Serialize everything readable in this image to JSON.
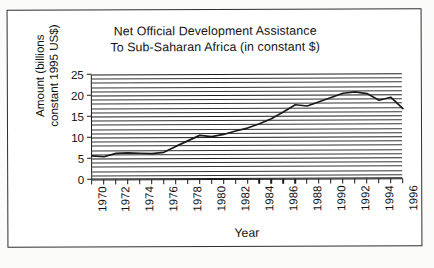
{
  "chart_data": {
    "type": "line",
    "title": "Net Official Development Assistance To Sub-Saharan Africa (in constant $)",
    "title_lines": [
      "Net Official Development Assistance",
      "To Sub-Saharan Africa (in constant $)"
    ],
    "xlabel": "Year",
    "ylabel": "Amount (billions constant 1995 US$)",
    "ylabel_lines": [
      "Amount (billions",
      "constant 1995 US$)"
    ],
    "xlim": [
      1970,
      1996
    ],
    "ylim": [
      0,
      25
    ],
    "ytick_values": [
      0,
      5,
      10,
      15,
      20,
      25
    ],
    "ytick_labels": [
      "0",
      "5",
      "10",
      "15",
      "20",
      "25"
    ],
    "xtick_values": [
      1970,
      1972,
      1974,
      1976,
      1978,
      1980,
      1982,
      1984,
      1986,
      1988,
      1990,
      1992,
      1994,
      1996
    ],
    "xtick_labels": [
      "1970",
      "1972",
      "1974",
      "1976",
      "1978",
      "1980",
      "1982",
      "1984",
      "1986",
      "1988",
      "1990",
      "1992",
      "1994",
      "1996"
    ],
    "grid": "horizontal gridlines every 1 unit",
    "grid_step": 1,
    "legend": "none",
    "line_color": "#1a1a1a",
    "x": [
      1970,
      1971,
      1972,
      1973,
      1974,
      1975,
      1976,
      1977,
      1978,
      1979,
      1980,
      1981,
      1982,
      1983,
      1984,
      1985,
      1986,
      1987,
      1988,
      1989,
      1990,
      1991,
      1992,
      1993,
      1994,
      1995,
      1996
    ],
    "values": [
      5.6,
      5.4,
      6.2,
      6.3,
      6.2,
      6.1,
      6.4,
      7.8,
      9.1,
      10.4,
      10.1,
      10.6,
      11.4,
      12.1,
      13.1,
      14.3,
      15.9,
      17.6,
      17.3,
      18.3,
      19.3,
      20.3,
      20.6,
      20.2,
      18.6,
      19.3,
      16.6
    ]
  }
}
